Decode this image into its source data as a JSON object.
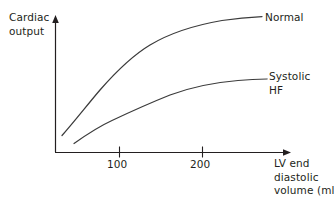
{
  "figure": {
    "axes": {
      "y_title_line1": "Cardiac",
      "y_title_line2": "output",
      "x_title_line1": "LV end",
      "x_title_line2": "diastolic",
      "x_title_line3": "volume (ml)"
    },
    "series_labels": {
      "normal_line1": "Normal",
      "systolic_line1": "Systolic",
      "systolic_line2": "HF"
    },
    "tick_labels": {
      "t100": "100",
      "t200": "200"
    },
    "colors": {
      "line": "#3b3b3b",
      "axis": "#231f20",
      "text": "#231f20",
      "background": "#ffffff"
    }
  },
  "chart_data": {
    "type": "line",
    "title": "",
    "subtitle": "",
    "xlabel": "LV end diastolic volume (ml)",
    "ylabel": "Cardiac output",
    "grid": false,
    "legend_position": "inline-right-end-labels",
    "xticks": [
      100,
      200
    ],
    "xtick_labels": [
      "100",
      "200"
    ],
    "yticks": [],
    "ytick_labels": [],
    "xlim": [
      0,
      290
    ],
    "ylim": [
      0,
      100
    ],
    "annotations": [
      {
        "text": "Normal",
        "attached_to": "Normal",
        "position": "right end of curve"
      },
      {
        "text": "Systolic HF",
        "attached_to": "Systolic HF",
        "position": "right end of curve"
      }
    ],
    "series": [
      {
        "name": "Normal",
        "x": [
          10,
          30,
          50,
          70,
          100,
          130,
          160,
          200,
          240,
          280
        ],
        "values": [
          13,
          29,
          43,
          55,
          69,
          79,
          86,
          92,
          96,
          100
        ]
      },
      {
        "name": "Systolic HF",
        "x": [
          25,
          45,
          70,
          100,
          130,
          160,
          200,
          240,
          280
        ],
        "values": [
          7,
          14,
          22,
          29,
          36,
          41,
          46,
          49,
          54
        ]
      }
    ]
  },
  "geometry": {
    "normal_path": "M 62,135.5 C 74,122 88,104 100,90 C 114,74 130,57 150,45 C 170,33 196,25 222,20.5 C 238,18 252,17 262,16.6",
    "systolic_path": "M 74,143.5 C 86,135 100,126 112,120.5 C 130,112 150,103 170,95 C 190,87.5 214,82.5 238,80.5 C 250,79.6 260,79.2 267,79",
    "y_axis": {
      "x": 55,
      "y_top": 21,
      "y_bottom": 152
    },
    "x_axis": {
      "y": 152,
      "x_left": 55,
      "x_right": 285
    },
    "ticks": [
      {
        "x": 119
      },
      {
        "x": 202
      }
    ],
    "tick_y_top": 147,
    "tick_y_bottom": 157
  }
}
